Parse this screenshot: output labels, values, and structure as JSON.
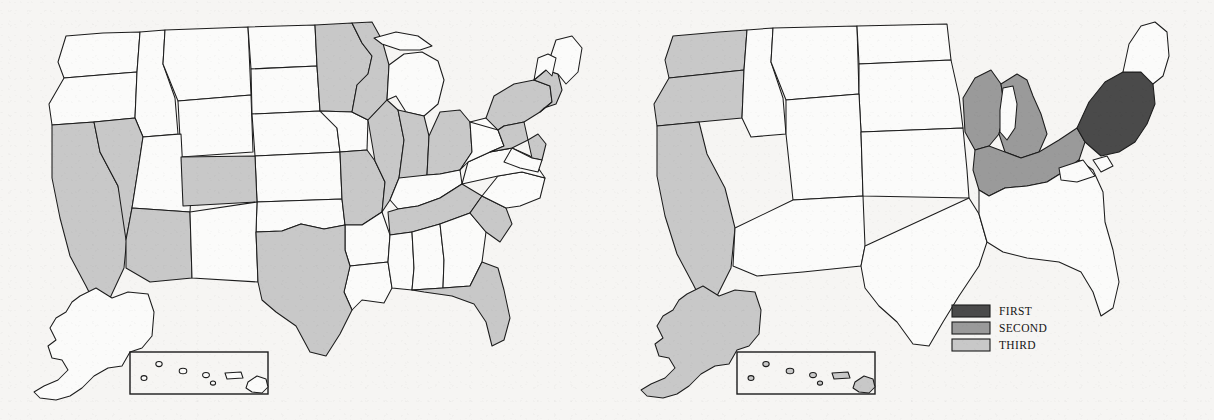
{
  "figure": {
    "kind": "two-panel-us-choropleth",
    "background_color": "#f6f5f3",
    "outline_color": "#1c1c1c",
    "width": 1214,
    "height": 420
  },
  "palette": {
    "first": "#4a4a4a",
    "second": "#9a9a9a",
    "third": "#c8c8c8",
    "unshaded": "#fbfbfa",
    "outline": "#1c1c1c"
  },
  "legend": {
    "name": "rank-legend",
    "panel": "right",
    "position": {
      "x": 952,
      "y": 308
    },
    "items": [
      {
        "label": "FIRST",
        "rank": 1,
        "color": "#4a4a4a"
      },
      {
        "label": "SECOND",
        "rank": 2,
        "color": "#9a9a9a"
      },
      {
        "label": "THIRD",
        "rank": 3,
        "color": "#c8c8c8"
      }
    ]
  },
  "panels": [
    {
      "id": "left",
      "name": "map-left",
      "has_legend": false,
      "insets": [
        {
          "name": "alaska-inset",
          "shaded": false,
          "rank": null
        },
        {
          "name": "hawaii-inset",
          "shaded": false,
          "rank": null
        }
      ],
      "shaded_states": [
        "California",
        "Nevada",
        "Arizona",
        "Colorado",
        "Texas",
        "Minnesota",
        "Wisconsin",
        "Missouri",
        "Illinois",
        "Indiana",
        "Ohio",
        "Tennessee",
        "South Carolina",
        "Florida",
        "New York",
        "Pennsylvania",
        "New Jersey",
        "Massachusetts",
        "Connecticut",
        "Rhode Island",
        "New Hampshire"
      ],
      "shade_rank": 3,
      "shade_color": "#c8c8c8"
    },
    {
      "id": "right",
      "name": "map-right",
      "has_legend": true,
      "insets": [
        {
          "name": "alaska-inset",
          "shaded": true,
          "rank": 3
        },
        {
          "name": "hawaii-inset",
          "shaded": true,
          "rank": 3
        }
      ],
      "regions": [
        {
          "name": "mid-atlantic-region",
          "rank": 1,
          "label": "FIRST",
          "color": "#4a4a4a",
          "states": [
            "New York",
            "Pennsylvania",
            "New Jersey",
            "Maryland",
            "Delaware"
          ]
        },
        {
          "name": "great-lakes-region",
          "rank": 2,
          "label": "SECOND",
          "color": "#9a9a9a",
          "states": [
            "Wisconsin",
            "Michigan",
            "Illinois",
            "Indiana",
            "Ohio"
          ]
        },
        {
          "name": "pacific-region",
          "rank": 3,
          "label": "THIRD",
          "color": "#c8c8c8",
          "states": [
            "Washington",
            "Oregon",
            "California",
            "Alaska",
            "Hawaii"
          ]
        }
      ]
    }
  ]
}
